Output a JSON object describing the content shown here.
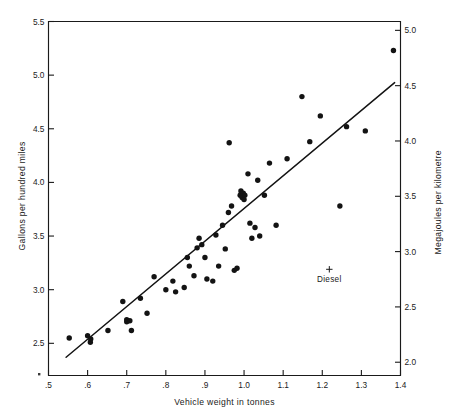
{
  "chart_data": {
    "type": "scatter",
    "title": "",
    "xlabel": "Vehicle weight in tonnes",
    "ylabel": "Gallons per hundred miles",
    "y2label": "Megajoules per kilometre",
    "xlim": [
      0.5,
      1.4
    ],
    "ylim": [
      2.2,
      5.5
    ],
    "y2lim": [
      1.88,
      5.08
    ],
    "grid": false,
    "legend": "none",
    "xticks": [
      ".5",
      ".6",
      ".7",
      ".8",
      ".9",
      "1.0",
      "1.1",
      "1.2",
      "1.3",
      "1.4"
    ],
    "xtick_values": [
      0.5,
      0.6,
      0.7,
      0.8,
      0.9,
      1.0,
      1.1,
      1.2,
      1.3,
      1.4
    ],
    "yticks": [
      "2.5",
      "3.0",
      "3.5",
      "4.0",
      "4.5",
      "5.0",
      "5.5"
    ],
    "ytick_values": [
      2.5,
      3.0,
      3.5,
      4.0,
      4.5,
      5.0,
      5.5
    ],
    "y2ticks": [
      "2.0",
      "2.5",
      "3.0",
      "3.5",
      "4.0",
      "4.5",
      "5.0"
    ],
    "y2tick_values": [
      2.0,
      2.5,
      3.0,
      3.5,
      4.0,
      4.5,
      5.0
    ],
    "series": [
      {
        "name": "Vehicles",
        "marker": "filled-circle",
        "color": "#131313",
        "points": [
          [
            0.553,
            2.55
          ],
          [
            0.6,
            2.57
          ],
          [
            0.607,
            2.51
          ],
          [
            0.608,
            2.54
          ],
          [
            0.652,
            2.62
          ],
          [
            0.69,
            2.89
          ],
          [
            0.7,
            2.72
          ],
          [
            0.7,
            2.7
          ],
          [
            0.708,
            2.71
          ],
          [
            0.712,
            2.62
          ],
          [
            0.735,
            2.92
          ],
          [
            0.752,
            2.78
          ],
          [
            0.77,
            3.12
          ],
          [
            0.8,
            3.0
          ],
          [
            0.818,
            3.08
          ],
          [
            0.825,
            2.98
          ],
          [
            0.847,
            3.02
          ],
          [
            0.855,
            3.3
          ],
          [
            0.86,
            3.22
          ],
          [
            0.872,
            3.13
          ],
          [
            0.88,
            3.39
          ],
          [
            0.885,
            3.48
          ],
          [
            0.892,
            3.42
          ],
          [
            0.9,
            3.3
          ],
          [
            0.905,
            3.1
          ],
          [
            0.92,
            3.08
          ],
          [
            0.928,
            3.51
          ],
          [
            0.935,
            3.22
          ],
          [
            0.945,
            3.6
          ],
          [
            0.952,
            3.38
          ],
          [
            0.96,
            3.72
          ],
          [
            0.962,
            4.37
          ],
          [
            0.968,
            3.78
          ],
          [
            0.975,
            3.18
          ],
          [
            0.982,
            3.2
          ],
          [
            0.99,
            3.88
          ],
          [
            0.992,
            3.92
          ],
          [
            0.995,
            3.86
          ],
          [
            0.998,
            3.9
          ],
          [
            1.0,
            3.84
          ],
          [
            1.002,
            3.88
          ],
          [
            1.01,
            4.08
          ],
          [
            1.015,
            3.62
          ],
          [
            1.02,
            3.48
          ],
          [
            1.028,
            3.58
          ],
          [
            1.035,
            4.02
          ],
          [
            1.04,
            3.5
          ],
          [
            1.052,
            3.88
          ],
          [
            1.065,
            4.18
          ],
          [
            1.082,
            3.6
          ],
          [
            1.11,
            4.22
          ],
          [
            1.148,
            4.8
          ],
          [
            1.168,
            4.38
          ],
          [
            1.195,
            4.62
          ],
          [
            1.245,
            3.78
          ],
          [
            1.262,
            4.52
          ],
          [
            1.31,
            4.48
          ],
          [
            1.382,
            5.23
          ]
        ]
      },
      {
        "name": "Diesel",
        "marker": "plus",
        "color": "#1a1a1a",
        "points": [
          [
            1.218,
            3.19
          ]
        ]
      }
    ],
    "fit_line": {
      "name": "regression-line",
      "x": [
        0.545,
        1.385
      ],
      "y": [
        2.37,
        4.93
      ]
    },
    "annotations": [
      {
        "name": "diesel-label",
        "text": "Diesel",
        "x": 1.218,
        "y": 3.07
      }
    ]
  }
}
